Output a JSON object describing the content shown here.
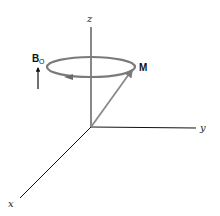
{
  "diagram": {
    "title": "",
    "axes": {
      "x_label": "x",
      "y_label": "y",
      "z_label": "z"
    },
    "vectors": {
      "magnetization_label": "M",
      "field_label": "B",
      "field_subscript": "O"
    },
    "colors": {
      "axis": "#111111",
      "precession": "#7a7a7a",
      "magnetization": "#8a8a8a",
      "field_arrow": "#111111",
      "background": "#ffffff"
    }
  }
}
